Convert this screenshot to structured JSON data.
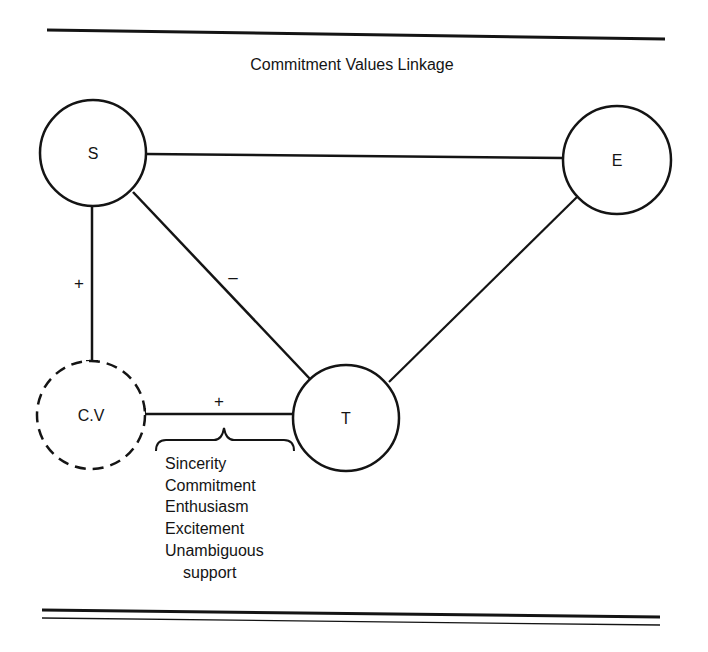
{
  "title": "Commitment Values Linkage",
  "nodes": {
    "s": {
      "label": "S",
      "style": "solid"
    },
    "e": {
      "label": "E",
      "style": "solid"
    },
    "t": {
      "label": "T",
      "style": "solid"
    },
    "cv": {
      "label": "C.V",
      "style": "dashed"
    }
  },
  "edges": {
    "s_e": {
      "from": "S",
      "to": "E",
      "sign": ""
    },
    "s_t": {
      "from": "S",
      "to": "T",
      "sign": "–"
    },
    "e_t": {
      "from": "E",
      "to": "T",
      "sign": ""
    },
    "s_cv": {
      "from": "S",
      "to": "C.V",
      "sign": "+"
    },
    "t_cv": {
      "from": "T",
      "to": "C.V",
      "sign": "+"
    }
  },
  "qualities": [
    "Sincerity",
    "Commitment",
    "Enthusiasm",
    "Excitement",
    "Unambiguous",
    "support"
  ],
  "colors": {
    "ink": "#141414",
    "paper": "#ffffff"
  }
}
